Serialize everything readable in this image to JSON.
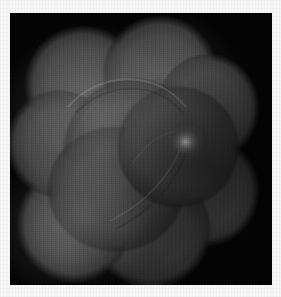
{
  "image": {
    "domain_label": "grayscale-medical-scan",
    "modality": "grayscale transillumination / microscopy scan",
    "frame": {
      "background_color": "#f7f7f7",
      "scan_background_color": "#030303",
      "left": 10,
      "top": 13,
      "width": 262,
      "height": 272
    },
    "subject": {
      "name": "lobed specimen mass",
      "description": "large cloud-lobed grayscale mass filling most of the dark field",
      "fill_color": "#404040",
      "edge_color": "#1e1e1e",
      "lobe_count": 10
    },
    "features": [
      {
        "name": "bright-nodule",
        "description": "focal bright nodule on the right-of-center region",
        "center_x": 180,
        "center_y": 127,
        "color": "#bababa"
      },
      {
        "name": "vessel-arc-upper",
        "description": "thin curved filament arcing across the upper-centre",
        "color": "#8c8c8c"
      },
      {
        "name": "vessel-arc-lower",
        "description": "thin curved filament descending toward lower-left",
        "color": "#7a7a7a"
      },
      {
        "name": "bright-patch-upper-left",
        "description": "diffuse brighter region upper-left of the mass",
        "color": "#585858"
      },
      {
        "name": "bright-patch-lower-left",
        "description": "diffuse brighter region lower-left of the mass",
        "color": "#4e4e4e"
      }
    ],
    "palette": {
      "paper": "#f7f7f7",
      "field": "#030303",
      "mass_mid": "#404040",
      "mass_light": "#585858",
      "highlight": "#bababa",
      "highlight_core": "#d6d6d6"
    },
    "artifacts": {
      "vertical_scanline_noise": true,
      "film_grain": true,
      "vignette": true
    }
  }
}
